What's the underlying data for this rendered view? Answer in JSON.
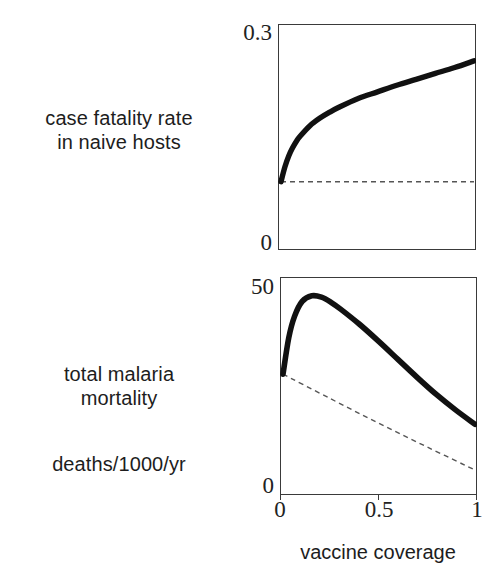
{
  "figure": {
    "xaxis_title": "vaccine coverage",
    "panels": [
      {
        "id": "case-fatality",
        "side_label": "case fatality rate\nin naive hosts",
        "y_max_label": "0.3",
        "y_min_label": "0"
      },
      {
        "id": "total-mortality",
        "side_label": "total malaria\nmortality",
        "units_label": "deaths/1000/yr",
        "y_max_label": "50",
        "y_min_label": "0"
      }
    ],
    "x_tick_labels": [
      "0",
      "0.5",
      "1"
    ]
  },
  "chart_data": [
    {
      "type": "line",
      "id": "case-fatality-rate",
      "title": "case fatality rate in naive hosts",
      "xlabel": "vaccine coverage",
      "ylabel": "case fatality rate in naive hosts",
      "xlim": [
        0,
        1
      ],
      "ylim": [
        0,
        0.3
      ],
      "xticks": [
        0,
        0.5,
        1
      ],
      "xticklabels": [
        "0",
        "0.5",
        "1"
      ],
      "yticks": [
        0,
        0.3
      ],
      "yticklabels": [
        "0",
        "0.3"
      ],
      "grid": false,
      "legend": "none",
      "series": [
        {
          "name": "with vaccination (evolved virulence)",
          "style": "solid-thick",
          "color": "#111111",
          "x": [
            0.0,
            0.02,
            0.04,
            0.06,
            0.08,
            0.1,
            0.15,
            0.2,
            0.25,
            0.3,
            0.4,
            0.5,
            0.6,
            0.7,
            0.8,
            0.9,
            1.0
          ],
          "y": [
            0.09,
            0.11,
            0.125,
            0.136,
            0.145,
            0.152,
            0.166,
            0.176,
            0.184,
            0.191,
            0.203,
            0.212,
            0.221,
            0.229,
            0.237,
            0.245,
            0.254
          ]
        },
        {
          "name": "no evolution (baseline)",
          "style": "dashed",
          "color": "#555555",
          "x": [
            0.0,
            1.0
          ],
          "y": [
            0.09,
            0.09
          ]
        }
      ]
    },
    {
      "type": "line",
      "id": "total-malaria-mortality",
      "title": "total malaria mortality",
      "xlabel": "vaccine coverage",
      "ylabel": "deaths/1000/yr",
      "xlim": [
        0,
        1
      ],
      "ylim": [
        0,
        50
      ],
      "xticks": [
        0,
        0.5,
        1
      ],
      "xticklabels": [
        "0",
        "0.5",
        "1"
      ],
      "yticks": [
        0,
        50
      ],
      "yticklabels": [
        "0",
        "50"
      ],
      "grid": false,
      "legend": "none",
      "series": [
        {
          "name": "with virulence evolution",
          "style": "solid-thick",
          "color": "#111111",
          "x": [
            0.0,
            0.03,
            0.06,
            0.1,
            0.15,
            0.2,
            0.25,
            0.3,
            0.4,
            0.5,
            0.6,
            0.7,
            0.8,
            0.9,
            1.0
          ],
          "y": [
            28.0,
            36.5,
            41.5,
            45.0,
            46.3,
            46.0,
            44.8,
            43.2,
            39.6,
            35.6,
            31.4,
            27.2,
            23.2,
            19.6,
            16.3
          ]
        },
        {
          "name": "no evolution (baseline)",
          "style": "dashed",
          "color": "#555555",
          "x": [
            0.0,
            0.25,
            0.5,
            0.75,
            1.0
          ],
          "y": [
            28.0,
            22.2,
            16.5,
            11.0,
            5.6
          ]
        }
      ]
    }
  ]
}
